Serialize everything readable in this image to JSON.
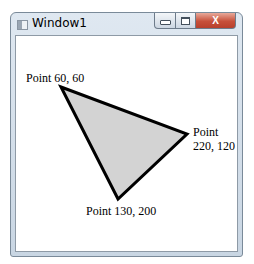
{
  "window": {
    "title": "Window1",
    "buttons": {
      "minimize": "minimize",
      "maximize": "maximize",
      "close": "X"
    }
  },
  "canvas": {
    "polygon": {
      "points": [
        [
          60,
          60
        ],
        [
          220,
          120
        ],
        [
          130,
          200
        ]
      ],
      "fill": "#d3d3d3",
      "stroke": "#000000"
    },
    "labels": {
      "p1": "Point 60, 60",
      "p2_line1": "Point",
      "p2_line2": "220, 120",
      "p3": "Point 130, 200"
    }
  }
}
